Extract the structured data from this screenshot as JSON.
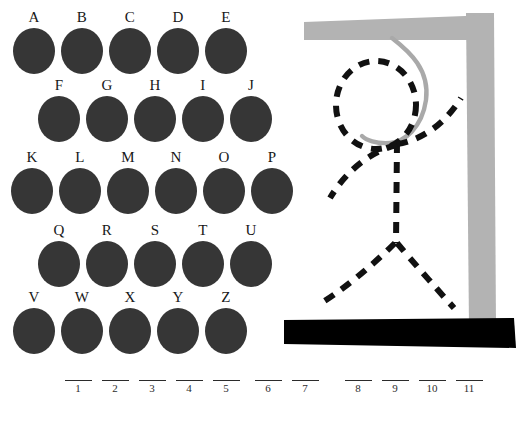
{
  "app": {
    "title": "Hangman",
    "background_color": "#ffffff"
  },
  "colors": {
    "key_fill": "#363636",
    "key_label": "#171717",
    "gallows_gray": "#b3b3b3",
    "rope_gray": "#a9a9a9",
    "base_black": "#000000",
    "figure_black": "#111111",
    "blank_line": "#2b2b2b"
  },
  "keyboard": {
    "name": "letter-keypad",
    "rows": [
      {
        "indent": 10,
        "top": 10,
        "keys": [
          {
            "letter": "A"
          },
          {
            "letter": "B"
          },
          {
            "letter": "C"
          },
          {
            "letter": "D"
          },
          {
            "letter": "E"
          }
        ]
      },
      {
        "indent": 35,
        "top": 78,
        "keys": [
          {
            "letter": "F"
          },
          {
            "letter": "G"
          },
          {
            "letter": "H"
          },
          {
            "letter": "I"
          },
          {
            "letter": "J"
          }
        ]
      },
      {
        "indent": 8,
        "top": 150,
        "keys": [
          {
            "letter": "K"
          },
          {
            "letter": "L"
          },
          {
            "letter": "M"
          },
          {
            "letter": "N"
          },
          {
            "letter": "O"
          },
          {
            "letter": "P"
          }
        ]
      },
      {
        "indent": 35,
        "top": 223,
        "keys": [
          {
            "letter": "Q"
          },
          {
            "letter": "R"
          },
          {
            "letter": "S"
          },
          {
            "letter": "T"
          },
          {
            "letter": "U"
          }
        ]
      },
      {
        "indent": 10,
        "top": 290,
        "keys": [
          {
            "letter": "V"
          },
          {
            "letter": "W"
          },
          {
            "letter": "X"
          },
          {
            "letter": "Y"
          },
          {
            "letter": "Z"
          }
        ]
      }
    ]
  },
  "gallows": {
    "name": "hangman-gallows",
    "parts_drawn": [
      "post",
      "crossbeam",
      "rope",
      "base",
      "head",
      "body",
      "left-arm",
      "right-arm",
      "left-leg",
      "right-leg"
    ],
    "figure_style": "dashed"
  },
  "puzzle": {
    "name": "answer-blanks",
    "total_blanks": 11,
    "groups": [
      {
        "left": 62,
        "slots": [
          {
            "number": "1",
            "letter": ""
          },
          {
            "number": "2",
            "letter": ""
          },
          {
            "number": "3",
            "letter": ""
          },
          {
            "number": "4",
            "letter": ""
          },
          {
            "number": "5",
            "letter": ""
          }
        ]
      },
      {
        "left": 252,
        "slots": [
          {
            "number": "6",
            "letter": ""
          },
          {
            "number": "7",
            "letter": ""
          }
        ]
      },
      {
        "left": 342,
        "slots": [
          {
            "number": "8",
            "letter": ""
          },
          {
            "number": "9",
            "letter": ""
          },
          {
            "number": "10",
            "letter": ""
          },
          {
            "number": "11",
            "letter": ""
          }
        ]
      }
    ]
  }
}
